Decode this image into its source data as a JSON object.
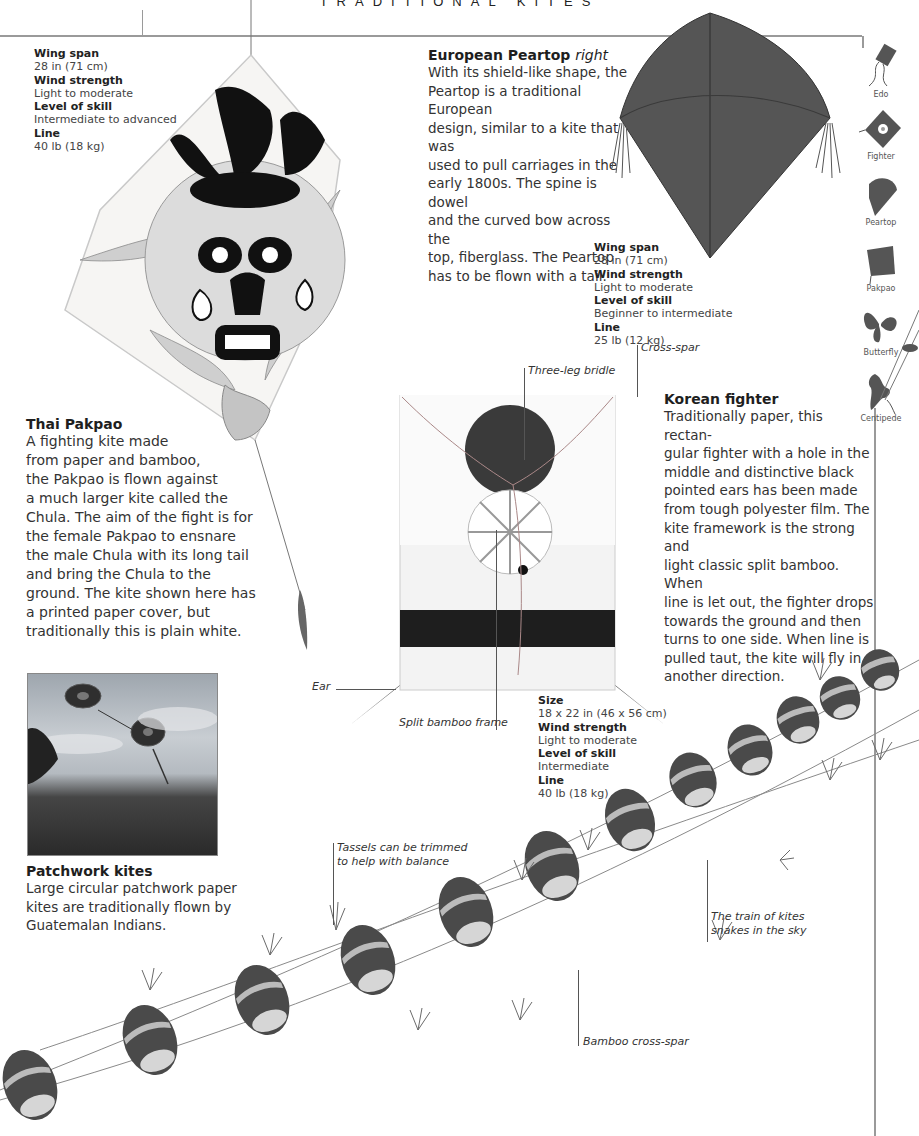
{
  "page": {
    "running_head": "TRADITIONAL KITES",
    "colors": {
      "rule": "#9a9a9a",
      "kite_red": "#6a6a6a",
      "kite_dark": "#2a2a2a"
    }
  },
  "thai_pakpao": {
    "specs": [
      {
        "key": "Wing span",
        "value": "28 in (71 cm)"
      },
      {
        "key": "Wind strength",
        "value": "Light to moderate"
      },
      {
        "key": "Level of skill",
        "value": "Intermediate to advanced"
      },
      {
        "key": "Line",
        "value": "40 lb (18 kg)"
      }
    ],
    "title": "Thai Pakpao",
    "lines": [
      "A fighting kite made",
      "from paper and bamboo,",
      "the Pakpao is flown against",
      "a much larger kite called the",
      "Chula. The aim of the fight is for",
      "the female Pakpao to ensnare",
      "the male Chula with its long tail",
      "and bring the Chula to the",
      "ground. The kite shown here has",
      "a printed paper cover, but",
      "traditionally this is plain white."
    ]
  },
  "european_peartop": {
    "title": "European Peartop",
    "title_suffix": "right",
    "lines": [
      "With its shield-like shape, the",
      "Peartop is a traditional European",
      "design, similar to a kite that was",
      "used to pull carriages in the",
      "early 1800s. The spine is dowel",
      "and the curved bow across the",
      "top, fiberglass. The Peartop",
      "has to be flown with a tail."
    ],
    "specs": [
      {
        "key": "Wing span",
        "value": "28 in (71 cm)"
      },
      {
        "key": "Wind strength",
        "value": "Light to moderate"
      },
      {
        "key": "Level of skill",
        "value": "Beginner to intermediate"
      },
      {
        "key": "Line",
        "value": "25 lb (12 kg)"
      }
    ]
  },
  "korean_fighter": {
    "title": "Korean fighter",
    "lines": [
      "Traditionally paper, this rectan-",
      "gular fighter with a hole in the",
      "middle and distinctive black",
      "pointed ears has been made",
      "from tough polyester film. The",
      "kite framework is the strong and",
      "light classic split bamboo. When",
      "line is let out, the fighter drops",
      "towards the ground and then",
      "turns to one side. When line is",
      "pulled taut, the kite will fly in",
      "another direction."
    ],
    "callouts": {
      "three_leg_bridle": "Three-leg bridle",
      "cross_spar": "Cross-spar",
      "ear": "Ear",
      "split_bamboo_frame": "Split bamboo frame"
    },
    "specs": [
      {
        "key": "Size",
        "value": "18 x 22 in (46 x 56 cm)"
      },
      {
        "key": "Wind strength",
        "value": "Light to moderate"
      },
      {
        "key": "Level of skill",
        "value": "Intermediate"
      },
      {
        "key": "Line",
        "value": "40 lb (18 kg)"
      }
    ]
  },
  "patchwork": {
    "title": "Patchwork kites",
    "lines": [
      "Large circular patchwork paper",
      "kites are traditionally flown by",
      "Guatemalan Indians."
    ]
  },
  "train": {
    "callouts": {
      "tassels_1": "Tassels can be trimmed",
      "tassels_2": "to help with balance",
      "train_1": "The train of kites",
      "train_2": "snakes in the sky",
      "bamboo_cross_spar": "Bamboo cross-spar"
    }
  },
  "kite_index": [
    {
      "label": "Edo",
      "icon": "edo-kite-icon"
    },
    {
      "label": "Fighter",
      "icon": "fighter-kite-icon"
    },
    {
      "label": "Peartop",
      "icon": "peartop-kite-icon"
    },
    {
      "label": "Pakpao",
      "icon": "pakpao-kite-icon"
    },
    {
      "label": "Butterfly",
      "icon": "butterfly-kite-icon"
    },
    {
      "label": "Centipede",
      "icon": "centipede-kite-icon"
    }
  ]
}
